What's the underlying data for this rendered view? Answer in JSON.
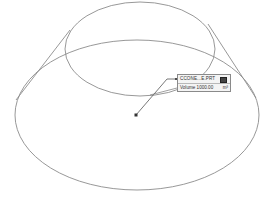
{
  "scene": {
    "object": "truncated-cone",
    "colors": {
      "background": "#ffffff",
      "edge": "#8c8c8c",
      "leader": "#555555",
      "callout_bg": "#f4f4f4",
      "callout_border": "#8a8a8a"
    }
  },
  "callout": {
    "part_name": "CCONE...E.PRT",
    "pin_icon": "square-pin-icon",
    "volume_label": "Volume",
    "volume_value": "1000.00",
    "volume_unit": "m³"
  }
}
